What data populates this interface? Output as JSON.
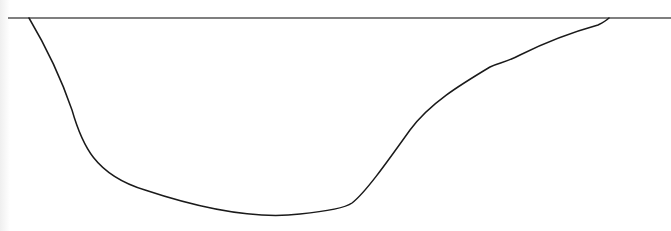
{
  "diagram": {
    "type": "cross-section-profile",
    "surface_line": {
      "x1": 8,
      "y1": 18,
      "x2": 671,
      "y2": 18,
      "color": "#555555",
      "stroke_width": 1.3
    },
    "profile_curve": {
      "color": "#1a1a1a",
      "stroke_width": 1.5,
      "path": "M 29 18 C 45 45, 60 75, 72 110 C 82 145, 95 175, 145 190 C 190 205, 250 220, 300 214 C 330 211, 345 208, 352 203 C 365 193, 385 165, 410 130 C 430 103, 460 85, 490 67 C 500 62, 505 63, 520 55 C 550 40, 580 30, 598 25 C 604 22, 607 20, 609 18"
    },
    "left_edge_shade": "#efefef"
  }
}
